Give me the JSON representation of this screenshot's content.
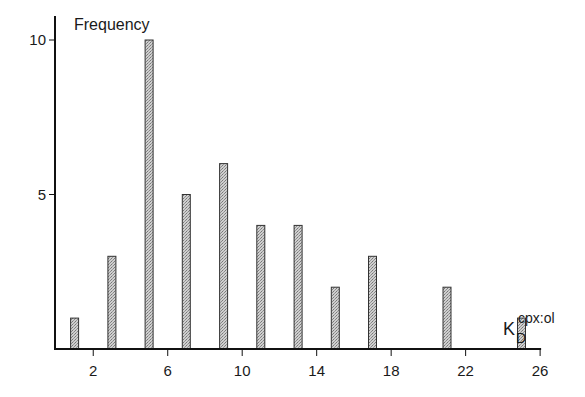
{
  "chart_data": {
    "type": "bar",
    "title": "",
    "ylabel": "Frequency",
    "xlabel": "K_D^cpx:ol",
    "xlabel_main": "K",
    "xlabel_sub": "D",
    "xlabel_sup": "cpx:ol",
    "x": [
      1,
      3,
      5,
      7,
      9,
      11,
      13,
      15,
      17,
      21,
      25
    ],
    "values": [
      1,
      3,
      10,
      5,
      6,
      4,
      4,
      2,
      3,
      2,
      1
    ],
    "xlim": [
      0,
      26
    ],
    "ylim": [
      0,
      10
    ],
    "xticks": [
      2,
      6,
      10,
      14,
      18,
      22,
      26
    ],
    "yticks": [
      5,
      10
    ],
    "grid": false,
    "legend": null,
    "bar_fill": "#bdbdbd",
    "bar_stroke": "#333333"
  }
}
